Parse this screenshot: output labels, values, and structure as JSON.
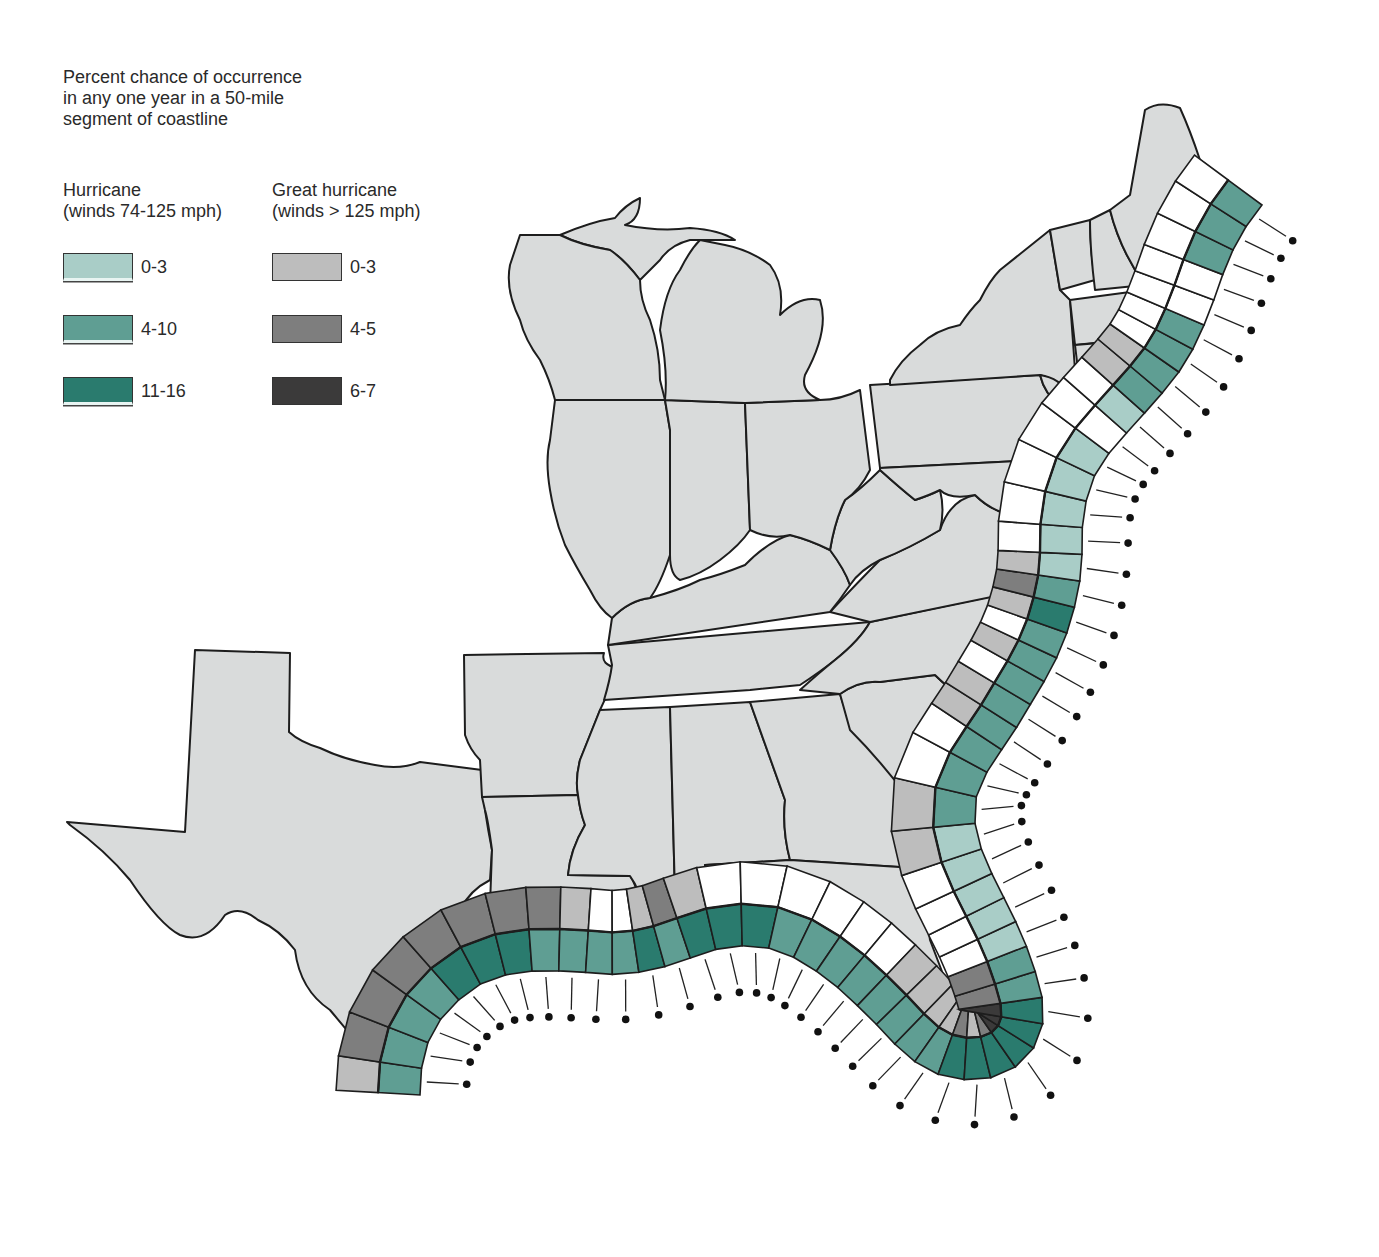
{
  "legend": {
    "title_lines": [
      "Percent chance of occurrence",
      "in any one year in a 50-mile",
      "segment of coastline"
    ],
    "hurricane": {
      "title": "Hurricane",
      "subtitle": "(winds 74-125 mph)",
      "classes": [
        {
          "label": "0-3",
          "color": "#a9cdc7"
        },
        {
          "label": "4-10",
          "color": "#5f9e93"
        },
        {
          "label": "11-16",
          "color": "#2a7b6e"
        }
      ]
    },
    "great_hurricane": {
      "title": "Great hurricane",
      "subtitle": "(winds > 125 mph)",
      "classes": [
        {
          "label": "0-3",
          "color": "#bdbdbd"
        },
        {
          "label": "4-5",
          "color": "#7e7e7e"
        },
        {
          "label": "6-7",
          "color": "#3b3a3a"
        }
      ]
    }
  },
  "colors": {
    "land": "#d9dbdb",
    "water": "#ffffff",
    "outline": "#1d1d1d",
    "none": "#ffffff"
  },
  "chart_data": {
    "type": "map",
    "title": "Percent chance of occurrence in any one year in a 50-mile segment of coastline",
    "region": "Eastern and Gulf coasts of the United States",
    "bands": [
      "hurricane (inner ring)",
      "great hurricane (outer ring)"
    ],
    "segment_order": "from Texas/Mexico border eastward along Gulf coast, around Florida, north along Atlantic coast to Maine",
    "segments": [
      {
        "h": "4-10",
        "g": "0-3"
      },
      {
        "h": "4-10",
        "g": "4-5"
      },
      {
        "h": "4-10",
        "g": "4-5"
      },
      {
        "h": "4-10",
        "g": "4-5"
      },
      {
        "h": "11-16",
        "g": "4-5"
      },
      {
        "h": "11-16",
        "g": "4-5"
      },
      {
        "h": "11-16",
        "g": "4-5"
      },
      {
        "h": "4-10",
        "g": "4-5"
      },
      {
        "h": "4-10",
        "g": "0-3"
      },
      {
        "h": "4-10",
        "g": "none"
      },
      {
        "h": "4-10",
        "g": "none"
      },
      {
        "h": "11-16",
        "g": "0-3"
      },
      {
        "h": "4-10",
        "g": "4-5"
      },
      {
        "h": "11-16",
        "g": "0-3"
      },
      {
        "h": "11-16",
        "g": "none"
      },
      {
        "h": "11-16",
        "g": "none"
      },
      {
        "h": "4-10",
        "g": "none"
      },
      {
        "h": "4-10",
        "g": "none"
      },
      {
        "h": "4-10",
        "g": "none"
      },
      {
        "h": "4-10",
        "g": "none"
      },
      {
        "h": "4-10",
        "g": "0-3"
      },
      {
        "h": "4-10",
        "g": "0-3"
      },
      {
        "h": "4-10",
        "g": "0-3"
      },
      {
        "h": "4-10",
        "g": "0-3"
      },
      {
        "h": "11-16",
        "g": "4-5"
      },
      {
        "h": "11-16",
        "g": "0-3"
      },
      {
        "h": "11-16",
        "g": "4-5"
      },
      {
        "h": "11-16",
        "g": "6-7"
      },
      {
        "h": "11-16",
        "g": "6-7"
      },
      {
        "h": "11-16",
        "g": "6-7"
      },
      {
        "h": "4-10",
        "g": "4-5"
      },
      {
        "h": "4-10",
        "g": "4-5"
      },
      {
        "h": "0-3",
        "g": "none"
      },
      {
        "h": "0-3",
        "g": "none"
      },
      {
        "h": "0-3",
        "g": "none"
      },
      {
        "h": "0-3",
        "g": "none"
      },
      {
        "h": "0-3",
        "g": "0-3"
      },
      {
        "h": "4-10",
        "g": "0-3"
      },
      {
        "h": "4-10",
        "g": "none"
      },
      {
        "h": "4-10",
        "g": "none"
      },
      {
        "h": "4-10",
        "g": "0-3"
      },
      {
        "h": "4-10",
        "g": "0-3"
      },
      {
        "h": "4-10",
        "g": "none"
      },
      {
        "h": "4-10",
        "g": "0-3"
      },
      {
        "h": "4-10",
        "g": "none"
      },
      {
        "h": "11-16",
        "g": "0-3"
      },
      {
        "h": "4-10",
        "g": "4-5"
      },
      {
        "h": "0-3",
        "g": "0-3"
      },
      {
        "h": "0-3",
        "g": "none"
      },
      {
        "h": "0-3",
        "g": "none"
      },
      {
        "h": "0-3",
        "g": "none"
      },
      {
        "h": "0-3",
        "g": "none"
      },
      {
        "h": "none",
        "g": "none"
      },
      {
        "h": "0-3",
        "g": "none"
      },
      {
        "h": "4-10",
        "g": "0-3"
      },
      {
        "h": "4-10",
        "g": "0-3"
      },
      {
        "h": "4-10",
        "g": "none"
      },
      {
        "h": "4-10",
        "g": "none"
      },
      {
        "h": "none",
        "g": "none"
      },
      {
        "h": "none",
        "g": "none"
      },
      {
        "h": "4-10",
        "g": "none"
      },
      {
        "h": "4-10",
        "g": "none"
      },
      {
        "h": "4-10",
        "g": "none"
      }
    ]
  }
}
